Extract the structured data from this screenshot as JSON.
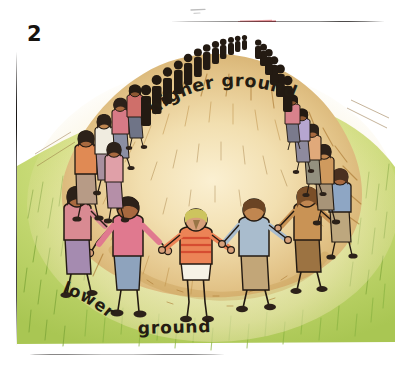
{
  "panel": {
    "number": "2",
    "labels": {
      "higher_ground": "higher  ground",
      "lower": "lower",
      "ground": "ground"
    }
  },
  "scene": {
    "description": "Hand drawn illustration of a large crowd of people holding hands in a ring around a bare hill",
    "hill_label": "higher ground",
    "field_label": "lower ground"
  },
  "colors": {
    "hill_light": "#f5e2b4",
    "hill_mid": "#e3c489",
    "hill_dark": "#c79a50",
    "hatch": "#a9762f",
    "grass_light": "#dce68f",
    "grass_mid": "#b8d15e",
    "grass_dark": "#96b843",
    "ink": "#231a12",
    "frame": "#141110",
    "accent_red": "#d4515d",
    "shirt_pink": "#e0798f",
    "shirt_orange": "#e8764a",
    "shirt_blue": "#9fb2c9",
    "shirt_tan": "#c89a63",
    "paper": "#ffffff"
  },
  "marks": {
    "top_red_mark": "red-smudge",
    "top_grey_mark": "grey-dash"
  }
}
